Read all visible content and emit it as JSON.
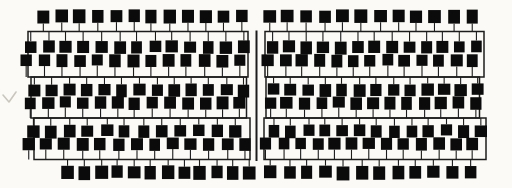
{
  "diagram": {
    "type": "schematic-grid",
    "colors": {
      "background": "#fbfaf6",
      "ink": "#1c1c1c",
      "cell_fill": "#0b0b0b",
      "pencil_mark": "#c9c6bd"
    },
    "canvas": {
      "width": 512,
      "height": 188
    },
    "line_widths": {
      "band": 1.5,
      "stem": 1.1,
      "divider": 2.0
    },
    "divider": {
      "x": 256.5,
      "y1": 30.5,
      "y2": 161.0
    },
    "artifact_mark": {
      "path": "M3,95 L9,102 L16,92",
      "stroke_width": 1.6
    },
    "halves": [
      {
        "name": "left",
        "bands": [
          {
            "x1": 28,
            "y1": 31.5,
            "x2": 248,
            "y2": 77
          },
          {
            "x1": 31,
            "y1": 77,
            "x2": 246.5,
            "y2": 118
          },
          {
            "x1": 34,
            "y1": 118,
            "x2": 250,
            "y2": 159.5
          }
        ],
        "rows": [
          {
            "count": 12,
            "x_start": 44,
            "x_end": 241,
            "y": 10,
            "w": 12,
            "h": 13,
            "stem": "down",
            "rail_y": 31.5
          },
          {
            "count": 13,
            "x_start": 31,
            "x_end": 243,
            "y": 41,
            "w": 11.5,
            "h": 12,
            "stem": "up",
            "rail_y": 31.5
          },
          {
            "count": 13,
            "x_start": 27,
            "x_end": 240,
            "y": 54.5,
            "w": 11.5,
            "h": 12,
            "stem": "down",
            "rail_y": 77
          },
          {
            "count": 13,
            "x_start": 35,
            "x_end": 244,
            "y": 84,
            "w": 11.5,
            "h": 12,
            "stem": "up",
            "rail_y": 77
          },
          {
            "count": 13,
            "x_start": 30,
            "x_end": 240,
            "y": 97,
            "w": 11.5,
            "h": 12,
            "stem": "down",
            "rail_y": 118
          },
          {
            "count": 12,
            "x_start": 33,
            "x_end": 235,
            "y": 125,
            "w": 11.5,
            "h": 12,
            "stem": "up",
            "rail_y": 118
          },
          {
            "count": 13,
            "x_start": 28,
            "x_end": 245,
            "y": 138,
            "w": 11.5,
            "h": 12,
            "stem": "down",
            "rail_y": 159.5
          },
          {
            "count": 12,
            "x_start": 68,
            "x_end": 250,
            "y": 166,
            "w": 12,
            "h": 13,
            "stem": "up",
            "rail_y": 159.5
          }
        ]
      },
      {
        "name": "right",
        "bands": [
          {
            "x1": 265,
            "y1": 31.5,
            "x2": 484,
            "y2": 77
          },
          {
            "x1": 266,
            "y1": 77,
            "x2": 479.5,
            "y2": 118
          },
          {
            "x1": 264,
            "y1": 118,
            "x2": 486,
            "y2": 159.5
          }
        ],
        "rows": [
          {
            "count": 12,
            "x_start": 269,
            "x_end": 472,
            "y": 10,
            "w": 12,
            "h": 13,
            "stem": "down",
            "rail_y": 31.5
          },
          {
            "count": 13,
            "x_start": 272,
            "x_end": 477,
            "y": 41,
            "w": 11.5,
            "h": 12,
            "stem": "up",
            "rail_y": 31.5
          },
          {
            "count": 13,
            "x_start": 268,
            "x_end": 473,
            "y": 54.5,
            "w": 11.5,
            "h": 12,
            "stem": "down",
            "rail_y": 77
          },
          {
            "count": 13,
            "x_start": 274,
            "x_end": 478,
            "y": 84,
            "w": 11.5,
            "h": 12,
            "stem": "up",
            "rail_y": 77
          },
          {
            "count": 13,
            "x_start": 270,
            "x_end": 475,
            "y": 97,
            "w": 11.5,
            "h": 12,
            "stem": "down",
            "rail_y": 118
          },
          {
            "count": 13,
            "x_start": 274,
            "x_end": 480,
            "y": 125,
            "w": 11.5,
            "h": 12,
            "stem": "up",
            "rail_y": 118
          },
          {
            "count": 13,
            "x_start": 266,
            "x_end": 473,
            "y": 138,
            "w": 11.5,
            "h": 12,
            "stem": "down",
            "rail_y": 159.5
          },
          {
            "count": 12,
            "x_start": 271,
            "x_end": 470,
            "y": 166,
            "w": 12,
            "h": 13,
            "stem": "up",
            "rail_y": 159.5
          }
        ]
      }
    ]
  }
}
